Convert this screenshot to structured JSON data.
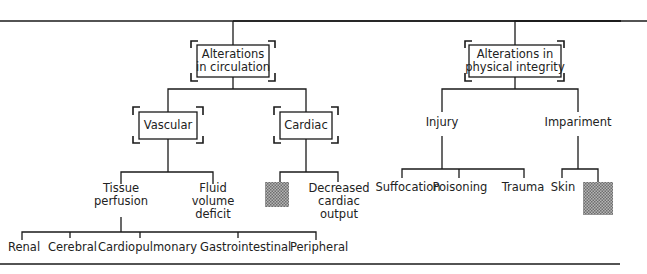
{
  "diagram": {
    "type": "hierarchy-tree",
    "nodes": {
      "circulation": {
        "lines": [
          "Alterations",
          "in circulation"
        ],
        "boxed": true
      },
      "physical": {
        "lines": [
          "Alterations in",
          "physical integrity"
        ],
        "boxed": true
      },
      "vascular": {
        "lines": [
          "Vascular"
        ],
        "boxed": true
      },
      "cardiac": {
        "lines": [
          "Cardiac"
        ],
        "boxed": true
      },
      "tissue": {
        "lines": [
          "Tissue",
          "perfusion"
        ]
      },
      "fluid": {
        "lines": [
          "Fluid",
          "volume",
          "deficit"
        ]
      },
      "cardiac_blank": {
        "lines": [],
        "shaded": true
      },
      "decreased": {
        "lines": [
          "Decreased",
          "cardiac",
          "output"
        ]
      },
      "injury": {
        "lines": [
          "Injury"
        ]
      },
      "impairment": {
        "lines": [
          "Impariment"
        ]
      },
      "renal": {
        "lines": [
          "Renal"
        ]
      },
      "cerebral": {
        "lines": [
          "Cerebral"
        ]
      },
      "cardiopulmonary": {
        "lines": [
          "Cardiopulmonary"
        ]
      },
      "gastrointestinal": {
        "lines": [
          "Gastrointestinal"
        ]
      },
      "peripheral": {
        "lines": [
          "Peripheral"
        ]
      },
      "suffocation": {
        "lines": [
          "Suffocation"
        ]
      },
      "poisoning": {
        "lines": [
          "Poisoning"
        ]
      },
      "trauma": {
        "lines": [
          "Trauma"
        ]
      },
      "skin": {
        "lines": [
          "Skin"
        ]
      },
      "impairment_blank": {
        "lines": [],
        "shaded": true
      }
    },
    "edges": [
      [
        "root",
        "circulation"
      ],
      [
        "root",
        "physical"
      ],
      [
        "circulation",
        "vascular"
      ],
      [
        "circulation",
        "cardiac"
      ],
      [
        "vascular",
        "tissue"
      ],
      [
        "vascular",
        "fluid"
      ],
      [
        "cardiac",
        "cardiac_blank"
      ],
      [
        "cardiac",
        "decreased"
      ],
      [
        "tissue",
        "renal"
      ],
      [
        "tissue",
        "cerebral"
      ],
      [
        "tissue",
        "cardiopulmonary"
      ],
      [
        "tissue",
        "gastrointestinal"
      ],
      [
        "tissue",
        "peripheral"
      ],
      [
        "physical",
        "injury"
      ],
      [
        "physical",
        "impairment"
      ],
      [
        "injury",
        "suffocation"
      ],
      [
        "injury",
        "poisoning"
      ],
      [
        "injury",
        "trauma"
      ],
      [
        "impairment",
        "skin"
      ],
      [
        "impairment",
        "impairment_blank"
      ]
    ],
    "colors": {
      "ink": "#1a1a1a",
      "shade": "#8a8a8a"
    }
  }
}
